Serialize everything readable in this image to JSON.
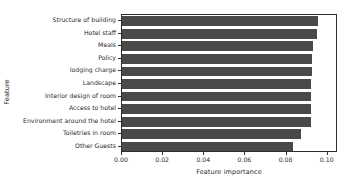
{
  "chart_data": {
    "type": "bar",
    "orientation": "horizontal",
    "title": "",
    "xlabel": "Feature importance",
    "ylabel": "Feature",
    "categories": [
      "Structure of building",
      "Hotel staff",
      "Meals",
      "Policy",
      "lodging charge",
      "Landscape",
      "Interior design of room",
      "Access to hotel",
      "Environment around the hotel",
      "Toiletries in room",
      "Other Guests"
    ],
    "values": [
      0.0954,
      0.0949,
      0.093,
      0.0926,
      0.0926,
      0.0921,
      0.0921,
      0.0921,
      0.0921,
      0.087,
      0.0833
    ],
    "xlim": [
      0.0,
      0.105
    ],
    "xticks": [
      0.0,
      0.02,
      0.04,
      0.06,
      0.08,
      0.1
    ],
    "xticklabels": [
      "0.00",
      "0.02",
      "0.04",
      "0.06",
      "0.08",
      "0.10"
    ],
    "grid": false,
    "legend": null,
    "bar_color": "#4a4a4a",
    "axis_color": "#2e2e2e",
    "background": "#ffffff"
  }
}
